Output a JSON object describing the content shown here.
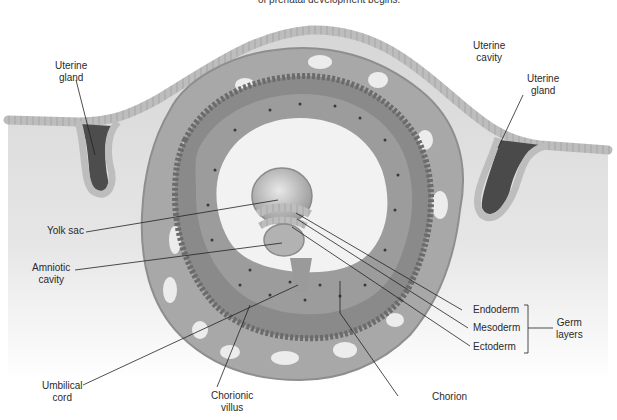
{
  "caption": "of prenatal development begins.",
  "labels": {
    "uterine_gland_left": [
      "Uterine",
      "gland"
    ],
    "uterine_cavity": [
      "Uterine",
      "cavity"
    ],
    "uterine_gland_right": [
      "Uterine",
      "gland"
    ],
    "yolk_sac": "Yolk sac",
    "amniotic_cavity": [
      "Amniotic",
      "cavity"
    ],
    "umbilical_cord": [
      "Umbilical",
      "cord"
    ],
    "chorionic_villus": [
      "Chorionic",
      "villus"
    ],
    "chorion": "Chorion",
    "endoderm": "Endoderm",
    "mesoderm": "Mesoderm",
    "ectoderm": "Ectoderm",
    "germ_layers": [
      "Germ",
      "layers"
    ]
  },
  "colors": {
    "tissue_bg": "#d9d9d9",
    "epithelium": "#b8b8b8",
    "chorion_outer": "#a3a3a3",
    "villus_dark": "#6f6f6f",
    "gland_dark": "#4a4a4a",
    "leader_line": "#222222"
  }
}
